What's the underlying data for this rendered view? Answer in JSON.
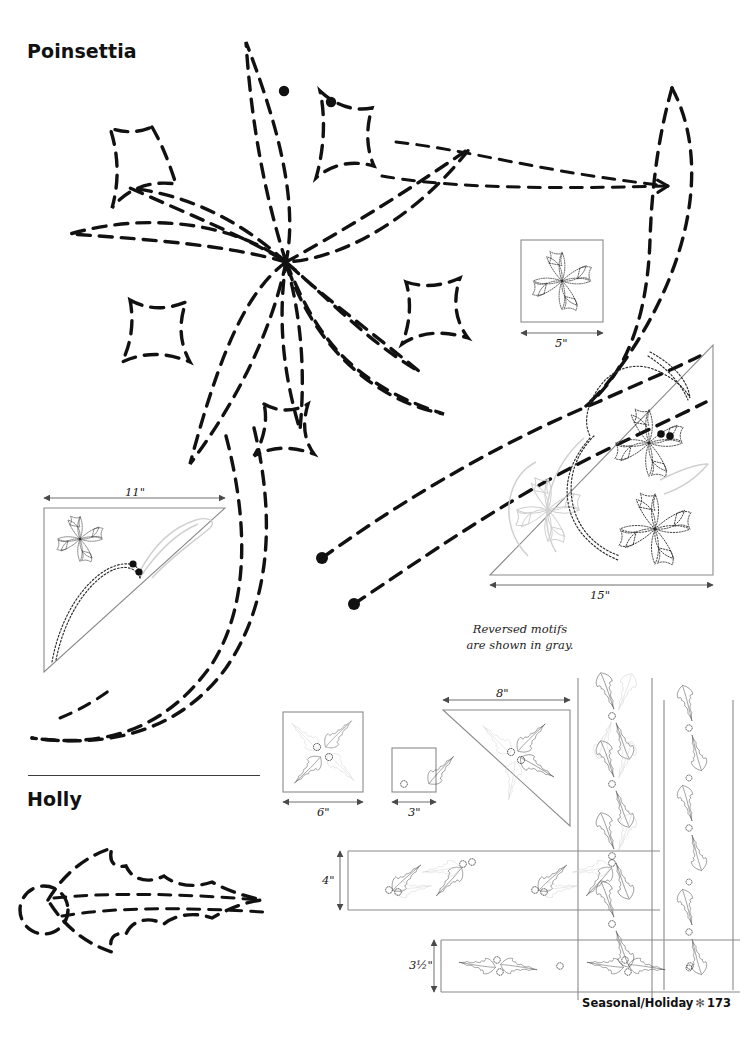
{
  "page": {
    "width": 756,
    "height": 1041,
    "background": "#ffffff",
    "ink": "#111111",
    "gray_motif_color": "#cfcfcf",
    "block_outline_color": "#8a8a8a",
    "stitch_color": "#2a2a2a"
  },
  "sections": [
    {
      "id": "poinsettia",
      "title": "Poinsettia"
    },
    {
      "id": "holly",
      "title": "Holly"
    }
  ],
  "note": {
    "line1": "Reversed motifs",
    "line2": "are shown in gray."
  },
  "blocks": [
    {
      "id": "poinsettia-square-5",
      "shape": "square",
      "label": "5\"",
      "motif": "poinsettia",
      "label_orientation": "horizontal"
    },
    {
      "id": "poinsettia-triangle-11",
      "shape": "triangle",
      "label": "11\"",
      "motif": "poinsettia + leaf",
      "label_orientation": "horizontal"
    },
    {
      "id": "poinsettia-triangle-15",
      "shape": "triangle",
      "label": "15\"",
      "motif": "poinsettia spray",
      "label_orientation": "horizontal"
    },
    {
      "id": "holly-square-6",
      "shape": "square",
      "label": "6\"",
      "motif": "holly pinwheel",
      "label_orientation": "horizontal"
    },
    {
      "id": "holly-square-3",
      "shape": "square",
      "label": "3\"",
      "motif": "single holly leaf",
      "label_orientation": "horizontal"
    },
    {
      "id": "holly-triangle-8",
      "shape": "triangle",
      "label": "8\"",
      "motif": "holly cluster",
      "label_orientation": "horizontal"
    },
    {
      "id": "holly-border-4",
      "shape": "border",
      "label": "4\"",
      "motif": "holly repeat",
      "label_orientation": "vertical"
    },
    {
      "id": "holly-border-3half",
      "shape": "border",
      "label": "3½\"",
      "motif": "holly repeat",
      "label_orientation": "vertical"
    }
  ],
  "footer": {
    "text": "Seasonal/Holiday",
    "ornament": "✻",
    "page_number": "173"
  }
}
